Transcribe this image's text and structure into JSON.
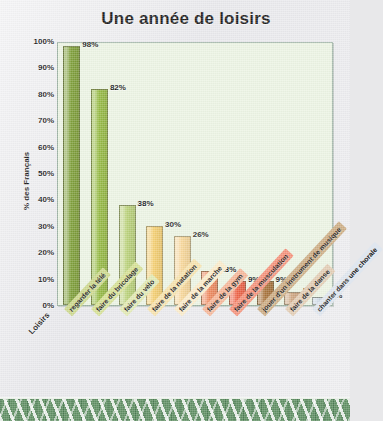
{
  "chart_data": {
    "type": "bar",
    "title": "Une année de loisirs",
    "xlabel": "Loisirs",
    "ylabel": "% des Français",
    "ylim": [
      0,
      100
    ],
    "grid": false,
    "legend": "none",
    "yticks": [
      "100%",
      "90%",
      "80%",
      "70%",
      "60%",
      "50%",
      "40%",
      "30%",
      "20%",
      "10%",
      "0%"
    ],
    "categories": [
      "regarder la télé",
      "faire du bricolage",
      "faire du vélo",
      "faire de la natation",
      "faire de la marche",
      "faire de la gym",
      "faire de la musculation",
      "jouer d'un instrument de musique",
      "faire de la danse",
      "chanter dans une chorale"
    ],
    "values": [
      98,
      82,
      38,
      30,
      26,
      13,
      9,
      9,
      5,
      3
    ],
    "value_labels": [
      "98%",
      "82%",
      "38%",
      "30%",
      "26%",
      "13%",
      "9%",
      "9%",
      "5%",
      "3%"
    ],
    "bar_colors": [
      "#7fa03a",
      "#97bb45",
      "#bad27a",
      "#f5cf72",
      "#f8d79a",
      "#f08a5f",
      "#ef6347",
      "#a9743c",
      "#cfa782",
      "#c6d4e2"
    ],
    "label_band_colors": [
      "#cdd98f",
      "#d6e196",
      "#e2eab4",
      "#f7e3ae",
      "#fbeccb",
      "#f6b79a",
      "#f5937c",
      "#cdae86",
      "#e3cdb5",
      "#dfe6ef"
    ]
  },
  "theme": {
    "plot_background": "#ecf4e4",
    "page_background": "#e9e9ec",
    "border_accent": "#5f8f63",
    "text_color": "#1b1b1b"
  }
}
